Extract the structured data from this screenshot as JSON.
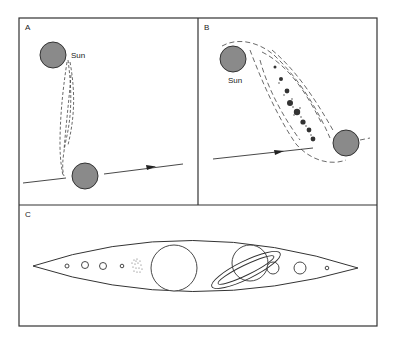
{
  "figure": {
    "panels": [
      {
        "id": "A",
        "label": "A",
        "sun_label": "Sun"
      },
      {
        "id": "B",
        "label": "B",
        "sun_label": "Sun"
      },
      {
        "id": "C",
        "label": "C"
      }
    ],
    "colors": {
      "body_fill": "#8a8a8a",
      "stroke": "#333333",
      "background": "#ffffff"
    }
  }
}
